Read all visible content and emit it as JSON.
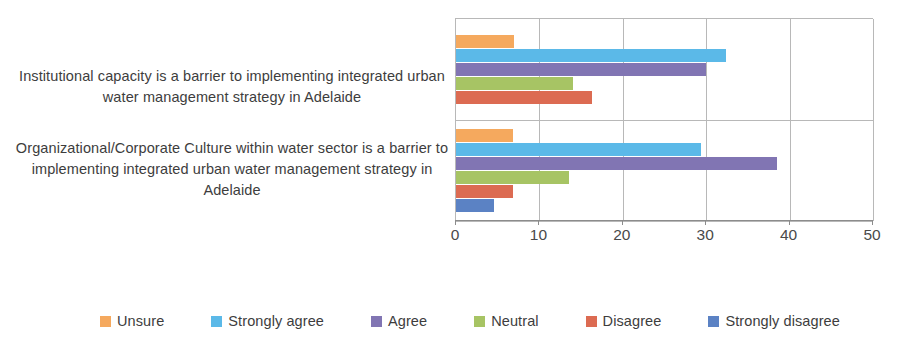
{
  "chart_data": {
    "type": "bar",
    "orientation": "horizontal",
    "title": "",
    "xlabel": "",
    "ylabel": "",
    "xlim": [
      0,
      50
    ],
    "xticks": [
      0,
      10,
      20,
      30,
      40,
      50
    ],
    "xticklabels": [
      "0",
      "10",
      "20",
      "30",
      "40",
      "50"
    ],
    "grid": true,
    "legend_position": "bottom",
    "categories": [
      "Institutional capacity is a barrier to implementing integrated urban water management strategy in Adelaide",
      "Organizational/Corporate Culture within water sector is a barrier to implementing integrated urban water management strategy in Adelaide"
    ],
    "series": [
      {
        "name": "Unsure",
        "color": "#F5A95E",
        "values": [
          7.0,
          6.8
        ]
      },
      {
        "name": "Strongly agree",
        "color": "#5BB9E8",
        "values": [
          32.4,
          29.4
        ]
      },
      {
        "name": "Agree",
        "color": "#8175B3",
        "values": [
          30.0,
          38.5
        ]
      },
      {
        "name": "Neutral",
        "color": "#A7C464",
        "values": [
          14.0,
          13.6
        ]
      },
      {
        "name": "Disagree",
        "color": "#DC6B52",
        "values": [
          16.3,
          6.8
        ]
      },
      {
        "name": "Strongly disagree",
        "color": "#5B82C4",
        "values": [
          null,
          4.5
        ]
      }
    ]
  },
  "axis": {
    "ticks": [
      "0",
      "10",
      "20",
      "30",
      "40",
      "50"
    ]
  },
  "categories": {
    "row0": "Institutional capacity is a barrier to implementing integrated urban water management strategy in Adelaide",
    "row1": "Organizational/Corporate Culture within water sector is a barrier to implementing integrated urban water management strategy in Adelaide"
  },
  "legend": {
    "items": [
      {
        "label": "Unsure",
        "color": "#F5A95E"
      },
      {
        "label": "Strongly agree",
        "color": "#5BB9E8"
      },
      {
        "label": "Agree",
        "color": "#8175B3"
      },
      {
        "label": "Neutral",
        "color": "#A7C464"
      },
      {
        "label": "Disagree",
        "color": "#DC6B52"
      },
      {
        "label": "Strongly disagree",
        "color": "#5B82C4"
      }
    ]
  }
}
